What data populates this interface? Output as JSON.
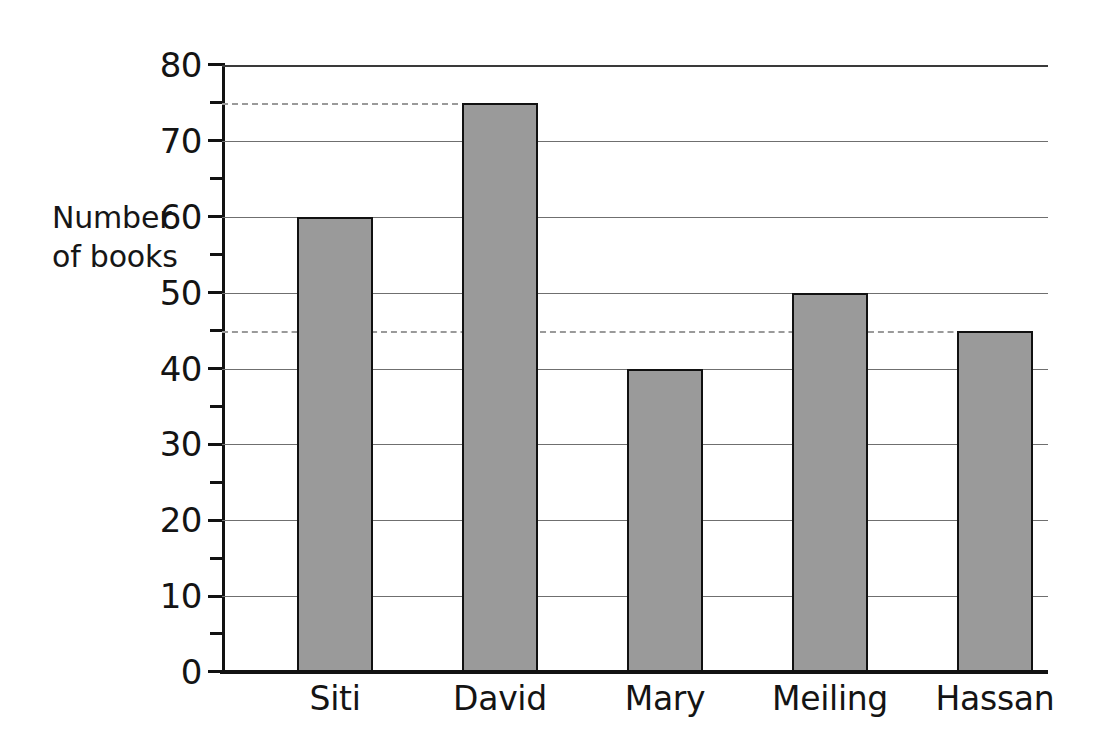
{
  "chart_data": {
    "type": "bar",
    "title": "",
    "xlabel": "",
    "ylabel": "Number\nof books",
    "categories": [
      "Siti",
      "David",
      "Mary",
      "Meiling",
      "Hassan"
    ],
    "values": [
      60,
      75,
      40,
      50,
      45
    ],
    "ylim": [
      0,
      80
    ],
    "y_major_ticks": [
      0,
      10,
      20,
      30,
      40,
      50,
      60,
      70,
      80
    ],
    "y_minor_ticks": [
      5,
      15,
      25,
      35,
      45,
      55,
      65,
      75
    ],
    "y_tick_labels": [
      "0",
      "10",
      "20",
      "30",
      "40",
      "50",
      "60",
      "70",
      "80"
    ],
    "grid": "horizontal-major-solid",
    "legend": "none",
    "bar_color": "#9a9a9a",
    "bar_border_color": "#111111",
    "gridline_color": "#6f6f6f",
    "axis_color": "#121212",
    "dashed_guides": [
      {
        "value": 75,
        "label": "75",
        "extends_to_category": "David",
        "color": "#9a9a9a"
      },
      {
        "value": 45,
        "label": "45",
        "extends_to_category": "Hassan",
        "color": "#9a9a9a"
      }
    ]
  }
}
